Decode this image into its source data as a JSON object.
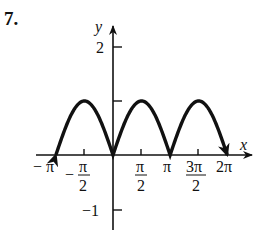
{
  "problem": {
    "number": "7."
  },
  "chart_data": {
    "type": "line",
    "title": "",
    "function": "y = |sin x|",
    "xlabel": "x",
    "ylabel": "y",
    "xlim": [
      -3.14159,
      6.28319
    ],
    "ylim": [
      -1.2,
      2.2
    ],
    "x_ticks": [
      "-π",
      "-π/2",
      "π/2",
      "π",
      "3π/2",
      "2π"
    ],
    "x_tick_values": [
      -3.14159,
      -1.5708,
      1.5708,
      3.14159,
      4.7124,
      6.28319
    ],
    "y_ticks": [
      "2",
      "1",
      "-1"
    ],
    "y_tick_values": [
      2,
      1,
      -1
    ],
    "y_tick_label_1_shown": false,
    "series": [
      {
        "name": "|sin x|",
        "x": [
          -3.14159,
          -2.356,
          -1.5708,
          -0.785,
          0,
          0.785,
          1.5708,
          2.356,
          3.14159,
          3.927,
          4.7124,
          5.498,
          6.28319
        ],
        "values": [
          0,
          0.707,
          1,
          0.707,
          0,
          0.707,
          1,
          0.707,
          0,
          0.707,
          1,
          0.707,
          0
        ]
      }
    ],
    "arrows_at_ends": true,
    "grid": false
  }
}
